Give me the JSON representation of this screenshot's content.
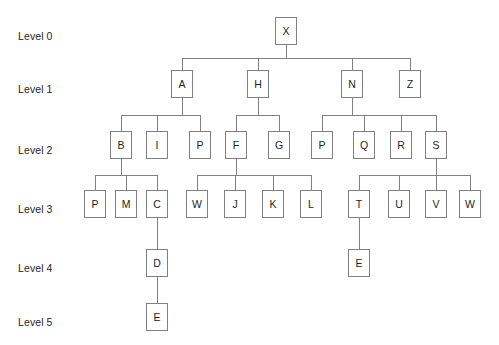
{
  "diagram": {
    "type": "tree",
    "title_sliver": "",
    "colors": {
      "background": "#ffffff",
      "node_border": "#808080",
      "node_fill": "#ffffff",
      "text": "#231f20",
      "edge": "#808080"
    },
    "level_labels": [
      {
        "text": "Level 0",
        "x": 18,
        "y": 30
      },
      {
        "text": "Level 1",
        "x": 18,
        "y": 83
      },
      {
        "text": "Level 2",
        "x": 18,
        "y": 144
      },
      {
        "text": "Level 3",
        "x": 18,
        "y": 203
      },
      {
        "text": "Level 4",
        "x": 18,
        "y": 262
      },
      {
        "text": "Level 5",
        "x": 18,
        "y": 316
      }
    ],
    "level_rows_y": [
      17,
      70,
      131,
      190,
      249,
      303
    ],
    "node_size": {
      "width": 22,
      "height": 28
    },
    "nodes": [
      {
        "id": "n0",
        "label": "X",
        "level": 0,
        "x": 275,
        "y": 17,
        "parent": null
      },
      {
        "id": "n1",
        "label": "A",
        "level": 1,
        "x": 171,
        "y": 70,
        "parent": "n0"
      },
      {
        "id": "n2",
        "label": "H",
        "level": 1,
        "x": 247,
        "y": 70,
        "parent": "n0"
      },
      {
        "id": "n3",
        "label": "N",
        "level": 1,
        "x": 341,
        "y": 70,
        "parent": "n0"
      },
      {
        "id": "n4",
        "label": "Z",
        "level": 1,
        "x": 399,
        "y": 70,
        "parent": "n0"
      },
      {
        "id": "n5",
        "label": "B",
        "level": 2,
        "x": 110,
        "y": 131,
        "parent": "n1"
      },
      {
        "id": "n6",
        "label": "I",
        "level": 2,
        "x": 146,
        "y": 131,
        "parent": "n1"
      },
      {
        "id": "n7",
        "label": "P",
        "level": 2,
        "x": 189,
        "y": 131,
        "parent": "n1"
      },
      {
        "id": "n8",
        "label": "F",
        "level": 2,
        "x": 225,
        "y": 131,
        "parent": "n2"
      },
      {
        "id": "n9",
        "label": "G",
        "level": 2,
        "x": 268,
        "y": 131,
        "parent": "n2"
      },
      {
        "id": "n10",
        "label": "P",
        "level": 2,
        "x": 311,
        "y": 131,
        "parent": "n3"
      },
      {
        "id": "n11",
        "label": "Q",
        "level": 2,
        "x": 353,
        "y": 131,
        "parent": "n3"
      },
      {
        "id": "n12",
        "label": "R",
        "level": 2,
        "x": 390,
        "y": 131,
        "parent": "n3"
      },
      {
        "id": "n13",
        "label": "S",
        "level": 2,
        "x": 425,
        "y": 131,
        "parent": "n3"
      },
      {
        "id": "n14",
        "label": "P",
        "level": 3,
        "x": 84,
        "y": 190,
        "parent": "n5"
      },
      {
        "id": "n15",
        "label": "M",
        "level": 3,
        "x": 115,
        "y": 190,
        "parent": "n5"
      },
      {
        "id": "n16",
        "label": "C",
        "level": 3,
        "x": 146,
        "y": 190,
        "parent": "n5"
      },
      {
        "id": "n17",
        "label": "W",
        "level": 3,
        "x": 186,
        "y": 190,
        "parent": "n8"
      },
      {
        "id": "n18",
        "label": "J",
        "level": 3,
        "x": 224,
        "y": 190,
        "parent": "n8"
      },
      {
        "id": "n19",
        "label": "K",
        "level": 3,
        "x": 262,
        "y": 190,
        "parent": "n8"
      },
      {
        "id": "n20",
        "label": "L",
        "level": 3,
        "x": 300,
        "y": 190,
        "parent": "n8"
      },
      {
        "id": "n21",
        "label": "T",
        "level": 3,
        "x": 348,
        "y": 190,
        "parent": "n13"
      },
      {
        "id": "n22",
        "label": "U",
        "level": 3,
        "x": 388,
        "y": 190,
        "parent": "n13"
      },
      {
        "id": "n23",
        "label": "V",
        "level": 3,
        "x": 425,
        "y": 190,
        "parent": "n13"
      },
      {
        "id": "n24",
        "label": "W",
        "level": 3,
        "x": 459,
        "y": 190,
        "parent": "n13"
      },
      {
        "id": "n25",
        "label": "D",
        "level": 4,
        "x": 146,
        "y": 249,
        "parent": "n16"
      },
      {
        "id": "n26",
        "label": "E",
        "level": 4,
        "x": 348,
        "y": 249,
        "parent": "n21"
      },
      {
        "id": "n27",
        "label": "E",
        "level": 5,
        "x": 146,
        "y": 303,
        "parent": "n25"
      }
    ]
  }
}
